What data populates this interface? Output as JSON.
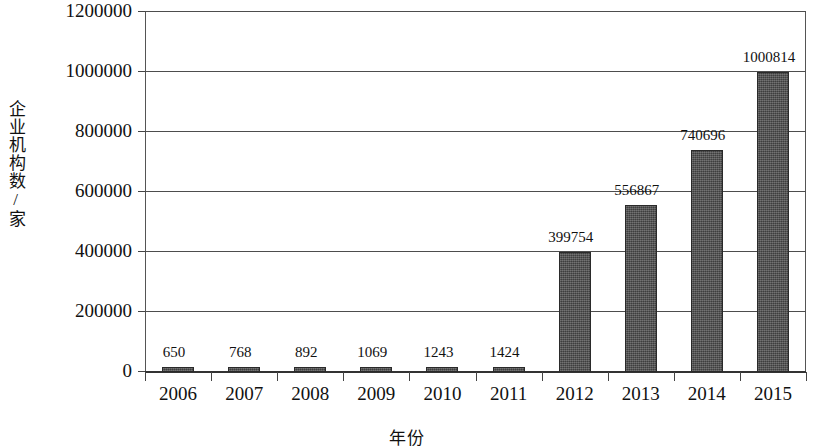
{
  "chart_data": {
    "type": "bar",
    "title": "",
    "subtitle": "",
    "xlabel": "年份",
    "ylabel": "企业机构数/家",
    "categories": [
      "2006",
      "2007",
      "2008",
      "2009",
      "2010",
      "2011",
      "2012",
      "2013",
      "2014",
      "2015"
    ],
    "values": [
      650,
      768,
      892,
      1069,
      1243,
      1424,
      399754,
      556867,
      740696,
      1000814
    ],
    "data_labels": [
      "650",
      "768",
      "892",
      "1069",
      "1243",
      "1424",
      "399754",
      "556867",
      "740696",
      "1000814"
    ],
    "ylim": [
      0,
      1200000
    ],
    "ytick_labels": [
      "1200000",
      "1000000",
      "800000",
      "600000",
      "400000",
      "200000",
      "0"
    ],
    "ytick_values": [
      1200000,
      1000000,
      800000,
      600000,
      400000,
      200000,
      0
    ],
    "grid": true,
    "legend": false,
    "legend_position": "none",
    "series": [
      {
        "name": "企业机构数/家",
        "color": "#4b4b4b",
        "values": [
          650,
          768,
          892,
          1069,
          1243,
          1424,
          399754,
          556867,
          740696,
          1000814
        ]
      }
    ],
    "colors": {
      "bar_fill": "#4b4b4b",
      "bar_outline": "#2a2a2a",
      "gridline": "#4d4d4d",
      "axis": "#333333",
      "text": "#111111",
      "background": "#ffffff"
    }
  }
}
